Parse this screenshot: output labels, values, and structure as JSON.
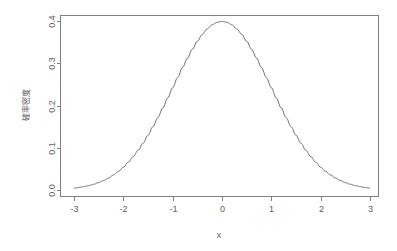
{
  "chart_data": {
    "type": "line",
    "title": "",
    "subtitle": "",
    "xlabel": "x",
    "ylabel": "確率密度",
    "xlim": [
      -3,
      3
    ],
    "ylim": [
      0.0,
      0.4
    ],
    "grid": false,
    "legend": null,
    "legend_position": "none",
    "line_color": "#6b6b6b",
    "axis_color": "#808080",
    "background_color": "#ffffff",
    "xticks": [
      "-3",
      "-2",
      "-1",
      "0",
      "1",
      "2",
      "3"
    ],
    "xtick_values": [
      -3,
      -2,
      -1,
      0,
      1,
      2,
      3
    ],
    "yticks": [
      "0.0",
      "0.1",
      "0.2",
      "0.3",
      "0.4"
    ],
    "ytick_values": [
      0.0,
      0.1,
      0.2,
      0.3,
      0.4
    ],
    "series": [
      {
        "name": "standard normal density",
        "x": [
          -3.0,
          -2.9,
          -2.8,
          -2.7,
          -2.6,
          -2.5,
          -2.4,
          -2.3,
          -2.2,
          -2.1,
          -2.0,
          -1.9,
          -1.8,
          -1.7,
          -1.6,
          -1.5,
          -1.4,
          -1.3,
          -1.2,
          -1.1,
          -1.0,
          -0.9,
          -0.8,
          -0.7,
          -0.6,
          -0.5,
          -0.4,
          -0.3,
          -0.2,
          -0.1,
          0.0,
          0.1,
          0.2,
          0.3,
          0.4,
          0.5,
          0.6,
          0.7,
          0.8,
          0.9,
          1.0,
          1.1,
          1.2,
          1.3,
          1.4,
          1.5,
          1.6,
          1.7,
          1.8,
          1.9,
          2.0,
          2.1,
          2.2,
          2.3,
          2.4,
          2.5,
          2.6,
          2.7,
          2.8,
          2.9,
          3.0
        ],
        "values": [
          0.0044,
          0.006,
          0.0079,
          0.0104,
          0.0136,
          0.0175,
          0.0224,
          0.0283,
          0.0355,
          0.044,
          0.054,
          0.0656,
          0.079,
          0.094,
          0.1109,
          0.1295,
          0.1497,
          0.1714,
          0.1942,
          0.2179,
          0.242,
          0.2661,
          0.2897,
          0.3123,
          0.3332,
          0.3521,
          0.3683,
          0.3814,
          0.391,
          0.397,
          0.3989,
          0.397,
          0.391,
          0.3814,
          0.3683,
          0.3521,
          0.3332,
          0.3123,
          0.2897,
          0.2661,
          0.242,
          0.2179,
          0.1942,
          0.1714,
          0.1497,
          0.1295,
          0.1109,
          0.094,
          0.079,
          0.0656,
          0.054,
          0.044,
          0.0355,
          0.0283,
          0.0224,
          0.0175,
          0.0136,
          0.0104,
          0.0079,
          0.006,
          0.0044
        ]
      }
    ],
    "annotations": []
  },
  "axes": {
    "x_title": "x",
    "y_title": "確率密度"
  }
}
